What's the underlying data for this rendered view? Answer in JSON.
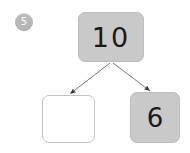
{
  "worksheet": {
    "question_number": "5",
    "type": "number-bond",
    "whole_box": {
      "value": "10",
      "filled": true,
      "fill_color": "#c9c9c9"
    },
    "part_boxes": [
      {
        "value": "",
        "filled": false,
        "fill_color": "#ffffff"
      },
      {
        "value": "6",
        "filled": true,
        "fill_color": "#c9c9c9"
      }
    ],
    "arrows": [
      {
        "name": "arrow-to-left-part",
        "direction": "down-left"
      },
      {
        "name": "arrow-to-right-part",
        "direction": "down-right"
      }
    ],
    "colors": {
      "background": "#ffffff",
      "box_fill": "#c9c9c9",
      "box_border": "#c4c4c4",
      "badge_fill": "#b8b8b8",
      "badge_text": "#ffffff",
      "numeral": "#1a1a1a",
      "arrow": "#555555"
    }
  }
}
